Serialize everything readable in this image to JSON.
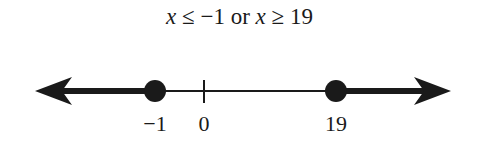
{
  "title": {
    "var1": "x",
    "op1": "≤",
    "val1": "−1",
    "conj": "or",
    "var2": "x",
    "op2": "≥",
    "val2": "19",
    "full": "x ≤ −1 or x ≥ 19"
  },
  "number_line": {
    "points": [
      {
        "value": -1,
        "label": "−1",
        "marker": "closed-dot"
      },
      {
        "value": 0,
        "label": "0",
        "marker": "tick"
      },
      {
        "value": 19,
        "label": "19",
        "marker": "closed-dot"
      }
    ],
    "shaded_regions": [
      {
        "from": "-infinity",
        "to": -1,
        "inclusive": true,
        "direction": "left-arrow"
      },
      {
        "from": 19,
        "to": "infinity",
        "inclusive": true,
        "direction": "right-arrow"
      }
    ],
    "colors": {
      "line": "#1a1a1a",
      "background": "#ffffff"
    }
  }
}
